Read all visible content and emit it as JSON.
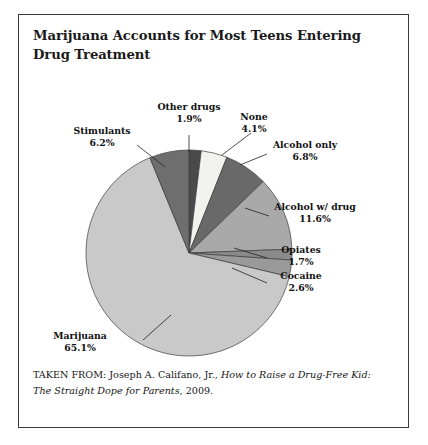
{
  "figure": {
    "title": "Marijuana Accounts for Most Teens Entering Drug Treatment",
    "citation_prefix": "TAKEN FROM: Joseph A. Califano, Jr., ",
    "citation_italic": "How to Raise a Drug-Free Kid: The Straight Dope for Parents",
    "citation_suffix": ", 2009."
  },
  "chart_data": {
    "type": "pie",
    "title": "Marijuana Accounts for Most Teens Entering Drug Treatment",
    "xlabel": "",
    "ylabel": "",
    "legend_position": "none",
    "grid": false,
    "units": "percent",
    "categories": [
      "Other drugs",
      "None",
      "Alcohol only",
      "Alcohol w/ drug",
      "Opiates",
      "Cocaine",
      "Marijuana",
      "Stimulants"
    ],
    "values": [
      1.9,
      4.1,
      6.8,
      11.6,
      1.7,
      2.6,
      65.1,
      6.2
    ],
    "slices": [
      {
        "label": "Other drugs",
        "value": 1.9,
        "pct_text": "1.9%",
        "color": "#4a4a4a"
      },
      {
        "label": "None",
        "value": 4.1,
        "pct_text": "4.1%",
        "color": "#f2f2ee"
      },
      {
        "label": "Alcohol only",
        "value": 6.8,
        "pct_text": "6.8%",
        "color": "#696969"
      },
      {
        "label": "Alcohol w/ drug",
        "value": 11.6,
        "pct_text": "11.6%",
        "color": "#a9a9a9"
      },
      {
        "label": "Opiates",
        "value": 1.7,
        "pct_text": "1.7%",
        "color": "#8a8a8a"
      },
      {
        "label": "Cocaine",
        "value": 2.6,
        "pct_text": "2.6%",
        "color": "#9a9a9a"
      },
      {
        "label": "Marijuana",
        "value": 65.1,
        "pct_text": "65.1%",
        "color": "#c9c9c9"
      },
      {
        "label": "Stimulants",
        "value": 6.2,
        "pct_text": "6.2%",
        "color": "#6e6e6e"
      }
    ]
  }
}
